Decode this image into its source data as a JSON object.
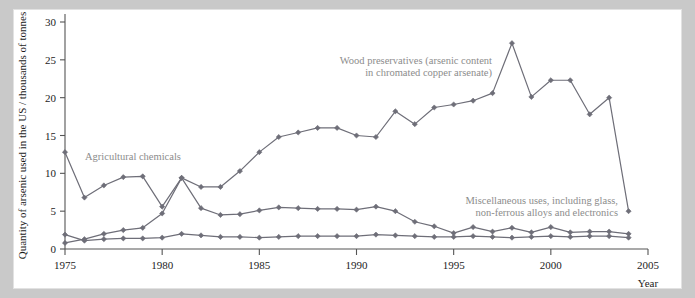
{
  "figure": {
    "background_color": "#c9c9c9",
    "panel_color": "#ffffff",
    "series_color": "#6e6e78",
    "annotation_color": "#8c8c8c",
    "axis_color": "#555555"
  },
  "axes": {
    "ylabel": "Quantity of arsenic used in the US / thousands of tonnes",
    "xlabel": "Year",
    "y_ticks": [
      "0",
      "5",
      "10",
      "15",
      "20",
      "25",
      "30"
    ],
    "x_ticks": [
      "1975",
      "1980",
      "1985",
      "1990",
      "1995",
      "2000",
      "2005"
    ]
  },
  "annotations": {
    "wood": {
      "line1": "Wood preservatives (arsenic content",
      "line2": "in chromated copper arsenate)"
    },
    "agricultural": {
      "line1": "Agricultural chemicals"
    },
    "misc": {
      "line1": "Miscellaneous uses, including glass,",
      "line2": "non-ferrous alloys and electronics"
    }
  },
  "chart_data": {
    "type": "line",
    "title": "",
    "xlabel": "Year",
    "ylabel": "Quantity of arsenic used in the US / thousands of tonnes",
    "xlim": [
      1975,
      2005
    ],
    "ylim": [
      0,
      30
    ],
    "xticks": [
      1975,
      1980,
      1985,
      1990,
      1995,
      2000,
      2005
    ],
    "yticks": [
      0,
      5,
      10,
      15,
      20,
      25,
      30
    ],
    "grid": false,
    "legend": "annotations-inline",
    "marker": "diamond",
    "x": [
      1975,
      1976,
      1977,
      1978,
      1979,
      1980,
      1981,
      1982,
      1983,
      1984,
      1985,
      1986,
      1987,
      1988,
      1989,
      1990,
      1991,
      1992,
      1993,
      1994,
      1995,
      1996,
      1997,
      1998,
      1999,
      2000,
      2001,
      2002,
      2003,
      2004
    ],
    "series": [
      {
        "name": "Wood preservatives (arsenic content in chromated copper arsenate)",
        "color": "#6e6e78",
        "values": [
          0.8,
          1.3,
          2.0,
          2.5,
          2.8,
          4.7,
          9.4,
          8.2,
          8.2,
          10.3,
          12.8,
          14.8,
          15.4,
          16.0,
          16.0,
          15.0,
          14.8,
          18.2,
          16.5,
          18.7,
          19.1,
          19.6,
          20.6,
          27.2,
          20.1,
          22.3,
          22.3,
          17.8,
          20.0,
          5.0
        ]
      },
      {
        "name": "Agricultural chemicals",
        "color": "#6e6e78",
        "values": [
          12.8,
          6.8,
          8.4,
          9.5,
          9.6,
          5.6,
          9.4,
          5.4,
          4.5,
          4.6,
          5.1,
          5.5,
          5.4,
          5.3,
          5.3,
          5.2,
          5.6,
          5.0,
          3.6,
          3.0,
          2.1,
          2.9,
          2.3,
          2.8,
          2.2,
          2.9,
          2.2,
          2.3,
          2.3,
          2.0
        ]
      },
      {
        "name": "Miscellaneous uses, including glass, non-ferrous alloys and electronics",
        "color": "#6e6e78",
        "values": [
          1.9,
          1.1,
          1.3,
          1.4,
          1.4,
          1.5,
          2.0,
          1.8,
          1.6,
          1.6,
          1.5,
          1.6,
          1.7,
          1.7,
          1.7,
          1.7,
          1.9,
          1.8,
          1.7,
          1.6,
          1.6,
          1.7,
          1.6,
          1.5,
          1.6,
          1.7,
          1.6,
          1.7,
          1.7,
          1.5
        ]
      }
    ]
  }
}
